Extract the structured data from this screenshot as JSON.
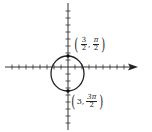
{
  "diagram": {
    "type": "polar-graph",
    "axes": {
      "horizontal": {
        "x_start": 5,
        "x_end": 138,
        "y": 67,
        "arrow": "right"
      },
      "vertical": {
        "x": 68,
        "y_start": 3,
        "y_end": 130
      },
      "tick_spacing_px": 7
    },
    "curve": {
      "shape": "circle",
      "cx": 67.5,
      "cy": 73.5,
      "rx": 16.5,
      "ry": 17.5,
      "color": "#222222"
    },
    "points": [
      {
        "label": "top-point",
        "coords_text": {
          "r_num": "3",
          "r_den": "2",
          "theta_num": "π",
          "theta_den": "2"
        },
        "x": 68,
        "y": 56
      },
      {
        "label": "bottom-point",
        "coords_text": {
          "r": "3",
          "theta_num": "3π",
          "theta_den": "2"
        },
        "x": 68,
        "y": 91
      }
    ]
  },
  "labels": {
    "top": {
      "open": "(",
      "r_num": "3",
      "r_den": "2",
      "comma": ",",
      "theta_num": "π",
      "theta_den": "2",
      "close": ")"
    },
    "bottom": {
      "open": "(",
      "r": "3",
      "comma": ",",
      "theta_num": "3π",
      "theta_den": "2",
      "close": ")"
    }
  }
}
